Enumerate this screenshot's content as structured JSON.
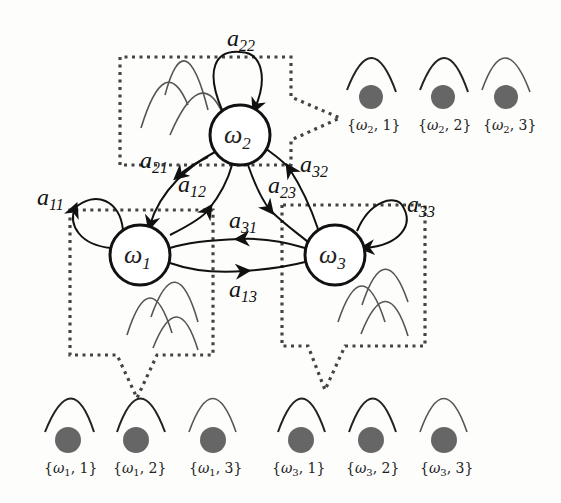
{
  "diagram": {
    "nodes": [
      {
        "id": "w1",
        "label": "ω",
        "sub": "1",
        "cx": 140,
        "cy": 255
      },
      {
        "id": "w2",
        "label": "ω",
        "sub": "2",
        "cx": 240,
        "cy": 135
      },
      {
        "id": "w3",
        "label": "ω",
        "sub": "3",
        "cx": 335,
        "cy": 255
      }
    ],
    "edges": {
      "a11": {
        "base": "a",
        "sub": "11"
      },
      "a12": {
        "base": "a",
        "sub": "12"
      },
      "a13": {
        "base": "a",
        "sub": "13"
      },
      "a21": {
        "base": "a",
        "sub": "21"
      },
      "a22": {
        "base": "a",
        "sub": "22"
      },
      "a23": {
        "base": "a",
        "sub": "23"
      },
      "a31": {
        "base": "a",
        "sub": "31"
      },
      "a32": {
        "base": "a",
        "sub": "32"
      },
      "a33": {
        "base": "a",
        "sub": "33"
      }
    },
    "emission_states": {
      "w1": [
        "{ω1, 1}",
        "{ω1, 2}",
        "{ω1, 3}"
      ],
      "w2": [
        "{ω2, 1}",
        "{ω2, 2}",
        "{ω2, 3}"
      ],
      "w3": [
        "{ω3, 1}",
        "{ω3, 2}",
        "{ω3, 3}"
      ]
    },
    "state_labels": {
      "w1_1": {
        "open": "{",
        "omega": "ω",
        "sub": "1",
        "rest": ", 1}"
      },
      "w1_2": {
        "open": "{",
        "omega": "ω",
        "sub": "1",
        "rest": ", 2}"
      },
      "w1_3": {
        "open": "{",
        "omega": "ω",
        "sub": "1",
        "rest": ", 3}"
      },
      "w2_1": {
        "open": "{",
        "omega": "ω",
        "sub": "2",
        "rest": ", 1}"
      },
      "w2_2": {
        "open": "{",
        "omega": "ω",
        "sub": "2",
        "rest": ", 2}"
      },
      "w2_3": {
        "open": "{",
        "omega": "ω",
        "sub": "2",
        "rest": ", 3}"
      },
      "w3_1": {
        "open": "{",
        "omega": "ω",
        "sub": "3",
        "rest": ", 1}"
      },
      "w3_2": {
        "open": "{",
        "omega": "ω",
        "sub": "3",
        "rest": ", 2}"
      },
      "w3_3": {
        "open": "{",
        "omega": "ω",
        "sub": "3",
        "rest": ", 3}"
      }
    },
    "colors": {
      "edge": "#111111",
      "box_dotted": "#444444",
      "emission_dot": "#666666",
      "curve": "#555555"
    }
  }
}
